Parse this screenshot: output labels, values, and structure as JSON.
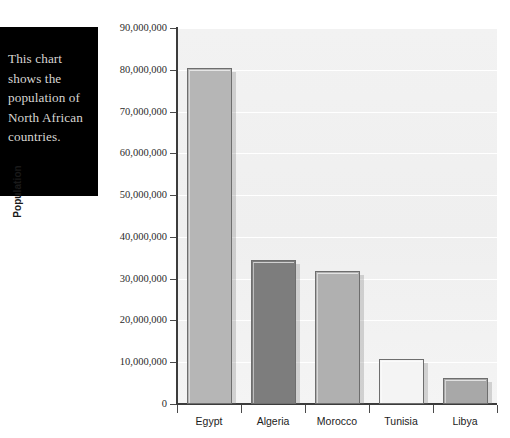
{
  "caption": {
    "text": "This chart\nshows the\npopulation of\nNorth African\ncountries."
  },
  "chart_data": {
    "type": "bar",
    "title": "",
    "xlabel": "",
    "ylabel": "Population",
    "categories": [
      "Egypt",
      "Algeria",
      "Morocco",
      "Tunisia",
      "Libya"
    ],
    "values": [
      80500000,
      34500000,
      31800000,
      10700000,
      6300000
    ],
    "ylim": [
      0,
      90000000
    ],
    "ytick_values": [
      0,
      10000000,
      20000000,
      30000000,
      40000000,
      50000000,
      60000000,
      70000000,
      80000000,
      90000000
    ],
    "ytick_labels": [
      "0",
      "10,000,000",
      "20,000,000",
      "30,000,000",
      "40,000,000",
      "50,000,000",
      "60,000,000",
      "70,000,000",
      "80,000,000",
      "90,000,000"
    ],
    "grid": true,
    "legend": false,
    "bar_colors": [
      "#b6b6b6",
      "#7d7d7d",
      "#b0b0b0",
      "#f4f4f4",
      "#a8a8a8"
    ],
    "bar_border_color": "#6e6e6e",
    "plot_background": "#f0f0f0",
    "gridline_color": "#ffffff",
    "axis_color": "#3c3c3c"
  }
}
